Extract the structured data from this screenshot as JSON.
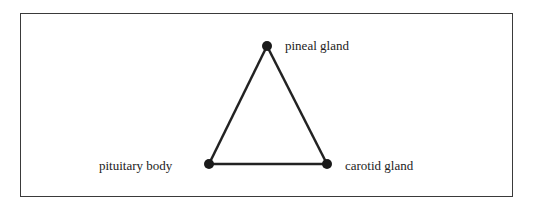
{
  "diagram": {
    "type": "triangle-network",
    "nodes": [
      {
        "id": "pineal",
        "label": "pineal gland"
      },
      {
        "id": "pituitary",
        "label": "pituitary body"
      },
      {
        "id": "carotid",
        "label": "carotid gland"
      }
    ],
    "edges": [
      {
        "from": "pineal",
        "to": "pituitary"
      },
      {
        "from": "pineal",
        "to": "carotid"
      },
      {
        "from": "pituitary",
        "to": "carotid"
      }
    ],
    "colors": {
      "line": "#222222",
      "node": "#1a1a1a",
      "frame": "#3a3a3a"
    }
  }
}
